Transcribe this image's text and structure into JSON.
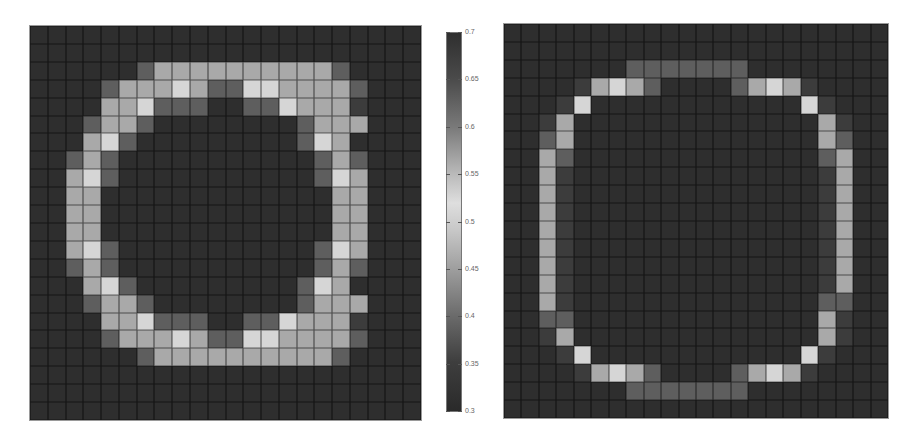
{
  "chart_data": [
    {
      "type": "heatmap",
      "title": "",
      "description": "Left panel: thick ring of elevated values on a 22x22 grid",
      "grid_size": [
        22,
        22
      ],
      "value_levels": {
        "d": 0.32,
        "n": 0.36,
        "m": 0.42,
        "l": 0.47,
        "b": 0.52
      },
      "rows": [
        "dddddddddddddddddddddd",
        "dddddddddddddddddddddd",
        "ddddddmllllllllllmdddd",
        "ddddmlllblmmbbllllmddd",
        "ddddllbmmmddmmblllnddd",
        "dddmllmddddddddmllldd d",
        "dddlbmdddddddddmbldddd",
        "ddmlmdddddddddddmlmddd",
        "ddlbmdddddddddddmblddd",
        "ddlldddddddddddddllddd",
        "ddlldddddddddddddllddd",
        "ddlldddddddddddddllddd",
        "ddlbmdddddddddddmblddd",
        "ddmlmdddddddddddmlmddd",
        "dddlbmdddddddddmbldddd",
        "dddmllmddddddddmllldd d",
        "ddddllbmmmddmmblllnddd",
        "ddddmlllblmmbbllllmddd",
        "ddddddmllllllllllmdddd",
        "dddddddddddddddddddddd",
        "dddddddddddddddddddddd",
        "dddddddddddddddddddddd"
      ]
    },
    {
      "type": "heatmap",
      "title": "",
      "description": "Right panel: thin ring of elevated values on a 22x22 grid",
      "grid_size": [
        22,
        22
      ],
      "value_levels": {
        "d": 0.32,
        "n": 0.36,
        "m": 0.42,
        "l": 0.47,
        "b": 0.52
      },
      "rows": [
        "dddddddddddddddddddddd",
        "dddddddddddddddddddddd",
        "dddddddmmmmmmmdddddddd",
        "ddddnlblmddddmlblndddd",
        "dddnbddddddddddddbnddd",
        "ddnlddddddddddddddlndd",
        "ddmlddddddddddddddlmdd",
        "ddlmddddddddddddddmldd",
        "ddlnddddddddddddddnldd",
        "ddlnddddddddddddddnldd",
        "ddlnddddddddddddddnldd",
        "ddlnddddddddddddddnldd",
        "ddlnddddddddddddddnldd",
        "ddlnddddddddddddddnldd",
        "ddlnddddddddddddddnldd",
        "ddlnddddddddddddddmmdd",
        "ddmmddddddddddddddlndd",
        "ddnlddddddddddddddlndd",
        "dddnbddddddddddddbnddd",
        "ddddnlblmddddmlblndddd",
        "dddddddmmmmmmmdddddddd",
        "dddddddddddddddddddddd"
      ]
    }
  ],
  "colorbar": {
    "min": 0.3,
    "max": 0.7,
    "ticks": [
      "0.7",
      "0.65",
      "0.6",
      "0.55",
      "0.5",
      "0.45",
      "0.4",
      "0.35",
      "0.3"
    ],
    "colormap": "diverging grayscale: dark at 0.3 and 0.7, lightest near 0.52",
    "orientation": "vertical"
  },
  "colors": {
    "d": "#2e2e2e",
    "n": "#3c3c3c",
    "m": "#5e5e5e",
    "l": "#a9a9a9",
    "b": "#d6d6d6"
  }
}
